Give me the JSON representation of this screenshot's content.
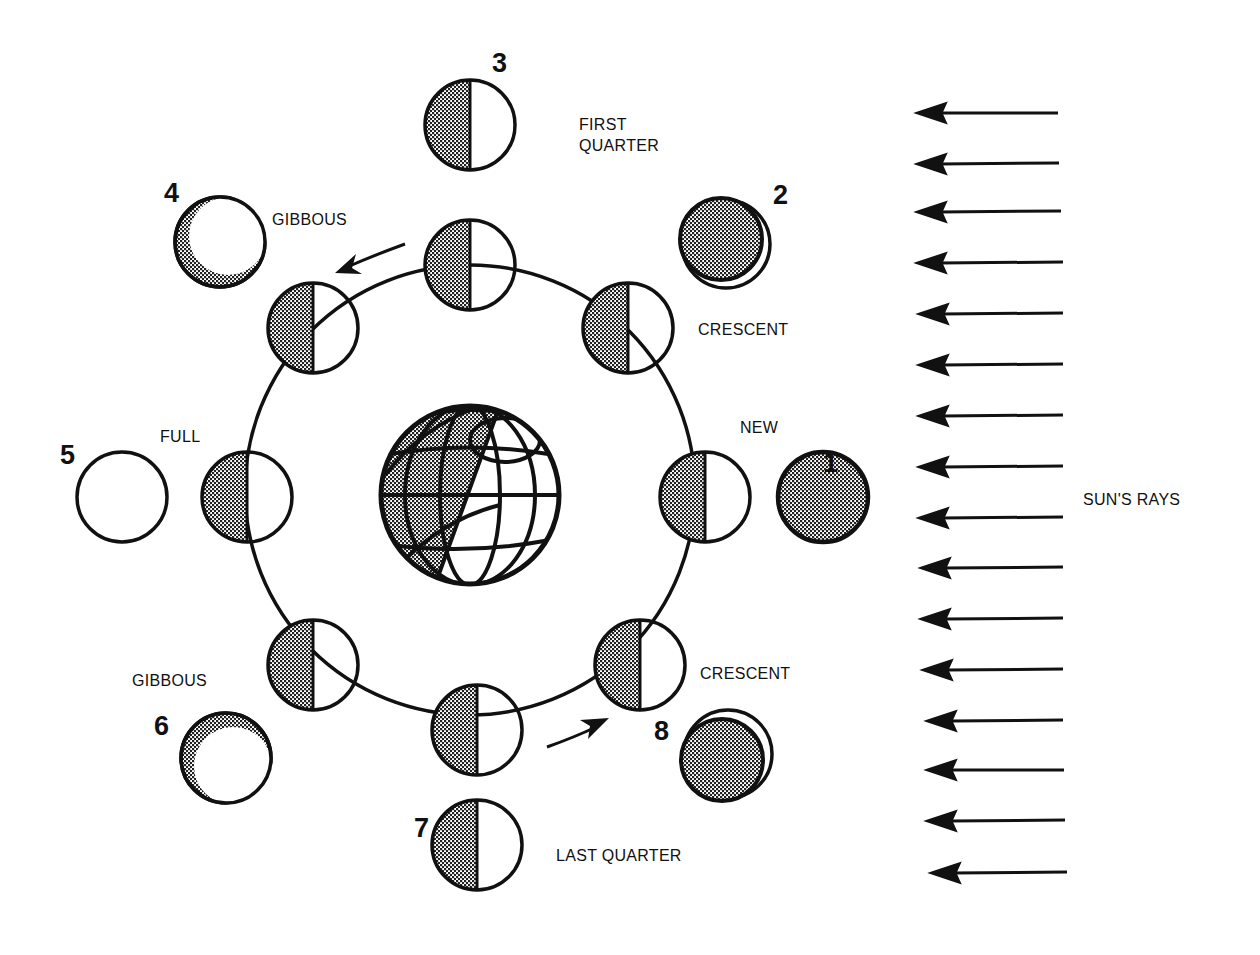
{
  "diagram": {
    "colors": {
      "ink": "#111111",
      "shade": "#8a8a8a",
      "background": "#ffffff"
    },
    "earth": {
      "label": "Earth",
      "cx": 470,
      "cy": 495,
      "r": 90
    },
    "orbit": {
      "cx": 470,
      "cy": 490,
      "r": 225
    },
    "orbit_direction": "counter-clockwise",
    "sun_rays": {
      "label": "SUN'S RAYS",
      "direction": "right-to-left",
      "count": 16
    },
    "phase_labels": {
      "first_quarter_line1": "FIRST",
      "first_quarter_line2": "QUARTER",
      "gibbous_top": "GIBBOUS",
      "crescent_top": "CRESCENT",
      "new": "NEW",
      "full": "FULL",
      "gibbous_bottom": "GIBBOUS",
      "crescent_bottom": "CRESCENT",
      "last_quarter": "LAST QUARTER"
    },
    "phases": [
      {
        "number": "1",
        "name": "NEW",
        "appearance": "fully shaded"
      },
      {
        "number": "2",
        "name": "CRESCENT",
        "appearance": "thin lit crescent on lower right"
      },
      {
        "number": "3",
        "name": "FIRST QUARTER",
        "appearance": "left half shaded, right half lit"
      },
      {
        "number": "4",
        "name": "GIBBOUS",
        "appearance": "mostly lit, thin shaded crescent lower left"
      },
      {
        "number": "5",
        "name": "FULL",
        "appearance": "fully lit"
      },
      {
        "number": "6",
        "name": "GIBBOUS",
        "appearance": "mostly lit, thin shaded crescent upper left"
      },
      {
        "number": "7",
        "name": "LAST QUARTER",
        "appearance": "left half shaded, right half lit"
      },
      {
        "number": "8",
        "name": "CRESCENT",
        "appearance": "thin lit crescent on upper right"
      }
    ]
  }
}
